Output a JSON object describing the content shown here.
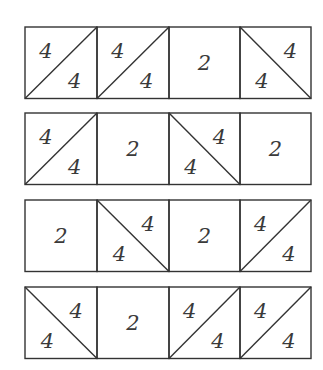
{
  "puzzle": {
    "rows": [
      {
        "cells": [
          {
            "type": "slash",
            "labels": [
              "4",
              "4"
            ]
          },
          {
            "type": "slash",
            "labels": [
              "4",
              "4"
            ]
          },
          {
            "type": "plain",
            "labels": [
              "2"
            ]
          },
          {
            "type": "backslash",
            "labels": [
              "4",
              "4"
            ]
          }
        ]
      },
      {
        "cells": [
          {
            "type": "slash",
            "labels": [
              "4",
              "4"
            ]
          },
          {
            "type": "plain",
            "labels": [
              "2"
            ]
          },
          {
            "type": "backslash",
            "labels": [
              "4",
              "4"
            ]
          },
          {
            "type": "plain",
            "labels": [
              "2"
            ]
          }
        ]
      },
      {
        "cells": [
          {
            "type": "plain",
            "labels": [
              "2"
            ]
          },
          {
            "type": "backslash",
            "labels": [
              "4",
              "4"
            ]
          },
          {
            "type": "plain",
            "labels": [
              "2"
            ]
          },
          {
            "type": "slash",
            "labels": [
              "4",
              "4"
            ]
          }
        ]
      },
      {
        "cells": [
          {
            "type": "backslash",
            "labels": [
              "4",
              "4"
            ]
          },
          {
            "type": "plain",
            "labels": [
              "2"
            ]
          },
          {
            "type": "slash",
            "labels": [
              "4",
              "4"
            ]
          },
          {
            "type": "slash",
            "labels": [
              "4",
              "4"
            ]
          }
        ]
      }
    ],
    "colors": {
      "line": "#333333",
      "text": "#3a3a3a",
      "background": "#ffffff"
    }
  }
}
